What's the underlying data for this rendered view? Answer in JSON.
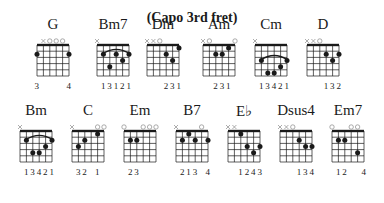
{
  "title": "(Capo 3rd fret)",
  "colors": {
    "ink": "#1a1a1a",
    "marker": "#888888"
  },
  "chords": [
    {
      "name": "G",
      "x": 37,
      "y": 38,
      "markers": [
        "",
        "x",
        "o",
        "o",
        "o",
        ""
      ],
      "dots": [
        [
          0,
          2
        ],
        [
          5,
          2
        ]
      ],
      "barre": null,
      "fingers": [
        "3",
        "",
        "",
        "",
        "",
        "4"
      ]
    },
    {
      "name": "Bm7",
      "x": 97,
      "y": 38,
      "markers": [
        "x",
        "",
        "",
        "",
        "",
        ""
      ],
      "dots": [
        [
          1,
          2
        ],
        [
          3,
          2
        ],
        [
          5,
          2
        ],
        [
          4,
          3
        ],
        [
          2,
          4
        ]
      ],
      "barre": [
        1,
        5
      ],
      "fingers": [
        "",
        "1",
        "3",
        "1",
        "2",
        "1"
      ]
    },
    {
      "name": "Dm",
      "x": 147,
      "y": 38,
      "markers": [
        "x",
        "x",
        "o",
        "",
        "",
        ""
      ],
      "dots": [
        [
          5,
          1
        ],
        [
          3,
          2
        ],
        [
          4,
          3
        ]
      ],
      "barre": null,
      "fingers": [
        "",
        "",
        "",
        "2",
        "3",
        "1"
      ]
    },
    {
      "name": "Am",
      "x": 203,
      "y": 38,
      "markers": [
        "x",
        "o",
        "",
        "",
        "",
        "o"
      ],
      "dots": [
        [
          4,
          1
        ],
        [
          2,
          2
        ],
        [
          3,
          2
        ]
      ],
      "barre": null,
      "fingers": [
        "",
        "",
        "2",
        "3",
        "1",
        ""
      ]
    },
    {
      "name": "Cm",
      "x": 255,
      "y": 38,
      "markers": [
        "x",
        "",
        "",
        "",
        "",
        ""
      ],
      "dots": [
        [
          1,
          3
        ],
        [
          5,
          3
        ],
        [
          4,
          4
        ],
        [
          2,
          5
        ],
        [
          3,
          5
        ]
      ],
      "barre": [
        1,
        5
      ],
      "fingers": [
        "",
        "1",
        "3",
        "4",
        "2",
        "1"
      ]
    },
    {
      "name": "D",
      "x": 307,
      "y": 38,
      "markers": [
        "x",
        "x",
        "o",
        "",
        "",
        ""
      ],
      "dots": [
        [
          3,
          2
        ],
        [
          5,
          2
        ],
        [
          4,
          3
        ]
      ],
      "barre": null,
      "fingers": [
        "",
        "",
        "",
        "1",
        "3",
        "2"
      ]
    },
    {
      "name": "Bm",
      "x": 20,
      "y": 124,
      "markers": [
        "x",
        "",
        "",
        "",
        "",
        ""
      ],
      "dots": [
        [
          1,
          2
        ],
        [
          5,
          2
        ],
        [
          4,
          3
        ],
        [
          2,
          4
        ],
        [
          3,
          4
        ]
      ],
      "barre": [
        1,
        5
      ],
      "fingers": [
        "",
        "1",
        "3",
        "4",
        "2",
        "1"
      ]
    },
    {
      "name": "C",
      "x": 72,
      "y": 124,
      "markers": [
        "x",
        "",
        "",
        "",
        "o",
        "o"
      ],
      "dots": [
        [
          4,
          1
        ],
        [
          2,
          2
        ],
        [
          1,
          3
        ]
      ],
      "barre": null,
      "fingers": [
        "",
        "3",
        "2",
        "",
        "1",
        ""
      ]
    },
    {
      "name": "Em",
      "x": 124,
      "y": 124,
      "markers": [
        "o",
        "",
        "",
        "o",
        "o",
        "o"
      ],
      "dots": [
        [
          1,
          2
        ],
        [
          2,
          2
        ]
      ],
      "barre": null,
      "fingers": [
        "",
        "2",
        "3",
        "",
        "",
        ""
      ]
    },
    {
      "name": "B7",
      "x": 176,
      "y": 124,
      "markers": [
        "x",
        "",
        "",
        "",
        "o",
        ""
      ],
      "dots": [
        [
          2,
          1
        ],
        [
          1,
          2
        ],
        [
          3,
          2
        ],
        [
          5,
          2
        ]
      ],
      "barre": null,
      "fingers": [
        "",
        "2",
        "1",
        "3",
        "",
        "4"
      ]
    },
    {
      "name": "E♭",
      "x": 228,
      "y": 124,
      "markers": [
        "x",
        "x",
        "",
        "",
        "",
        ""
      ],
      "dots": [
        [
          2,
          1
        ],
        [
          3,
          3
        ],
        [
          5,
          3
        ],
        [
          4,
          4
        ]
      ],
      "barre": null,
      "fingers": [
        "",
        "",
        "1",
        "2",
        "4",
        "3"
      ]
    },
    {
      "name": "Dsus4",
      "x": 280,
      "y": 124,
      "markers": [
        "x",
        "x",
        "o",
        "",
        "",
        ""
      ],
      "dots": [
        [
          3,
          2
        ],
        [
          4,
          3
        ],
        [
          5,
          3
        ]
      ],
      "barre": null,
      "fingers": [
        "",
        "",
        "",
        "1",
        "3",
        "4"
      ]
    },
    {
      "name": "Em7",
      "x": 332,
      "y": 124,
      "markers": [
        "o",
        "",
        "",
        "o",
        "o",
        ""
      ],
      "dots": [
        [
          1,
          2
        ],
        [
          2,
          2
        ],
        [
          4,
          4
        ]
      ],
      "barre": null,
      "fingers": [
        "",
        "1",
        "2",
        "",
        "",
        "4"
      ]
    }
  ]
}
